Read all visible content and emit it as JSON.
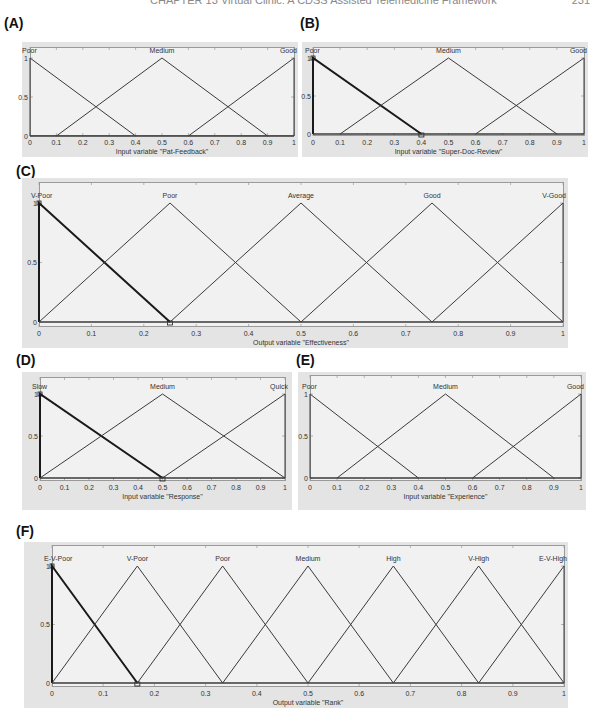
{
  "page": {
    "header_text": "CHAPTER 13  Virtual Clinic: A CDSS Assisted Telemedicine Framework",
    "page_number": "231"
  },
  "style": {
    "line_color": "#3a3a3a",
    "selected_line_color": "#1a1a1a",
    "frame_color": "#e4e4e4",
    "plot_bg": "#f1f1f1"
  },
  "chart_data": [
    {
      "id": "A",
      "panel_label": "(A)",
      "type": "line",
      "title": "",
      "xlabel": "Input variable \"Pat-Feedback\"",
      "ylabel": "",
      "xlim": [
        0,
        1
      ],
      "ylim": [
        0,
        1
      ],
      "xticks": [
        "0",
        "0.1",
        "0.2",
        "0.3",
        "0.4",
        "0.5",
        "0.6",
        "0.7",
        "0.8",
        "0.9",
        "1"
      ],
      "yticks": [
        "0",
        "0.5",
        "1"
      ],
      "selected_mf": null,
      "series": [
        {
          "name": "Poor",
          "x": [
            0,
            0,
            0.4
          ],
          "y": [
            0,
            1,
            0
          ]
        },
        {
          "name": "Medium",
          "x": [
            0.1,
            0.5,
            0.9
          ],
          "y": [
            0,
            1,
            0
          ]
        },
        {
          "name": "Good",
          "x": [
            0.6,
            1,
            1
          ],
          "y": [
            0,
            1,
            0
          ]
        }
      ]
    },
    {
      "id": "B",
      "panel_label": "(B)",
      "type": "line",
      "title": "",
      "xlabel": "Input variable \"Super-Doc-Review\"",
      "ylabel": "",
      "xlim": [
        0,
        1
      ],
      "ylim": [
        0,
        1
      ],
      "xticks": [
        "0",
        "0.1",
        "0.2",
        "0.3",
        "0.4",
        "0.5",
        "0.6",
        "0.7",
        "0.8",
        "0.9",
        "1"
      ],
      "yticks": [
        "0",
        "0.5",
        "1"
      ],
      "selected_mf": "Poor",
      "series": [
        {
          "name": "Poor",
          "x": [
            0,
            0,
            0.4
          ],
          "y": [
            0,
            1,
            0
          ]
        },
        {
          "name": "Medium",
          "x": [
            0.1,
            0.5,
            0.9
          ],
          "y": [
            0,
            1,
            0
          ]
        },
        {
          "name": "Good",
          "x": [
            0.6,
            1,
            1
          ],
          "y": [
            0,
            1,
            0
          ]
        }
      ]
    },
    {
      "id": "C",
      "panel_label": "(C)",
      "type": "line",
      "title": "",
      "xlabel": "Output variable \"Effectiveness\"",
      "ylabel": "",
      "xlim": [
        0,
        1
      ],
      "ylim": [
        0,
        1
      ],
      "xticks": [
        "0",
        "0.1",
        "0.2",
        "0.3",
        "0.4",
        "0.5",
        "0.6",
        "0.7",
        "0.8",
        "0.9",
        "1"
      ],
      "yticks": [
        "0",
        "0.5",
        "1"
      ],
      "selected_mf": "V-Poor",
      "series": [
        {
          "name": "V-Poor",
          "x": [
            0,
            0,
            0.25
          ],
          "y": [
            0,
            1,
            0
          ]
        },
        {
          "name": "Poor",
          "x": [
            0,
            0.25,
            0.5
          ],
          "y": [
            0,
            1,
            0
          ]
        },
        {
          "name": "Average",
          "x": [
            0.25,
            0.5,
            0.75
          ],
          "y": [
            0,
            1,
            0
          ]
        },
        {
          "name": "Good",
          "x": [
            0.5,
            0.75,
            1
          ],
          "y": [
            0,
            1,
            0
          ]
        },
        {
          "name": "V-Good",
          "x": [
            0.75,
            1,
            1
          ],
          "y": [
            0,
            1,
            0
          ]
        }
      ]
    },
    {
      "id": "D",
      "panel_label": "(D)",
      "type": "line",
      "title": "",
      "xlabel": "Input variable \"Response\"",
      "ylabel": "",
      "xlim": [
        0,
        1
      ],
      "ylim": [
        0,
        1
      ],
      "xticks": [
        "0",
        "0.1",
        "0.2",
        "0.3",
        "0.4",
        "0.5",
        "0.6",
        "0.7",
        "0.8",
        "0.9",
        "1"
      ],
      "yticks": [
        "0",
        "0.5",
        "1"
      ],
      "selected_mf": "Slow",
      "series": [
        {
          "name": "Slow",
          "x": [
            0,
            0,
            0.5
          ],
          "y": [
            0,
            1,
            0
          ]
        },
        {
          "name": "Medium",
          "x": [
            0,
            0.5,
            1
          ],
          "y": [
            0,
            1,
            0
          ]
        },
        {
          "name": "Quick",
          "x": [
            0.5,
            1,
            1
          ],
          "y": [
            0,
            1,
            0
          ]
        }
      ]
    },
    {
      "id": "E",
      "panel_label": "(E)",
      "type": "line",
      "title": "",
      "xlabel": "Input variable \"Experience\"",
      "ylabel": "",
      "xlim": [
        0,
        1
      ],
      "ylim": [
        0,
        1
      ],
      "xticks": [
        "0",
        "0.1",
        "0.2",
        "0.3",
        "0.4",
        "0.5",
        "0.6",
        "0.7",
        "0.8",
        "0.9",
        "1"
      ],
      "yticks": [
        "0",
        "0.5",
        "1"
      ],
      "selected_mf": null,
      "series": [
        {
          "name": "Poor",
          "x": [
            0,
            0,
            0.4
          ],
          "y": [
            0,
            1,
            0
          ]
        },
        {
          "name": "Medium",
          "x": [
            0.1,
            0.5,
            0.9
          ],
          "y": [
            0,
            1,
            0
          ]
        },
        {
          "name": "Good",
          "x": [
            0.6,
            1,
            1
          ],
          "y": [
            0,
            1,
            0
          ]
        }
      ]
    },
    {
      "id": "F",
      "panel_label": "(F)",
      "type": "line",
      "title": "",
      "xlabel": "Output variable \"Rank\"",
      "ylabel": "",
      "xlim": [
        0,
        1
      ],
      "ylim": [
        0,
        1
      ],
      "xticks": [
        "0",
        "0.1",
        "0.2",
        "0.3",
        "0.4",
        "0.5",
        "0.6",
        "0.7",
        "0.8",
        "0.9",
        "1"
      ],
      "yticks": [
        "0",
        "0.5",
        "1"
      ],
      "selected_mf": "E-V-Poor",
      "series": [
        {
          "name": "E-V-Poor",
          "x": [
            0,
            0,
            0.1667
          ],
          "y": [
            0,
            1,
            0
          ]
        },
        {
          "name": "V-Poor",
          "x": [
            0,
            0.1667,
            0.3333
          ],
          "y": [
            0,
            1,
            0
          ]
        },
        {
          "name": "Poor",
          "x": [
            0.1667,
            0.3333,
            0.5
          ],
          "y": [
            0,
            1,
            0
          ]
        },
        {
          "name": "Medium",
          "x": [
            0.3333,
            0.5,
            0.6667
          ],
          "y": [
            0,
            1,
            0
          ]
        },
        {
          "name": "High",
          "x": [
            0.5,
            0.6667,
            0.8333
          ],
          "y": [
            0,
            1,
            0
          ]
        },
        {
          "name": "V-High",
          "x": [
            0.6667,
            0.8333,
            1
          ],
          "y": [
            0,
            1,
            0
          ]
        },
        {
          "name": "E-V-High",
          "x": [
            0.8333,
            1,
            1
          ],
          "y": [
            0,
            1,
            0
          ]
        }
      ]
    }
  ]
}
